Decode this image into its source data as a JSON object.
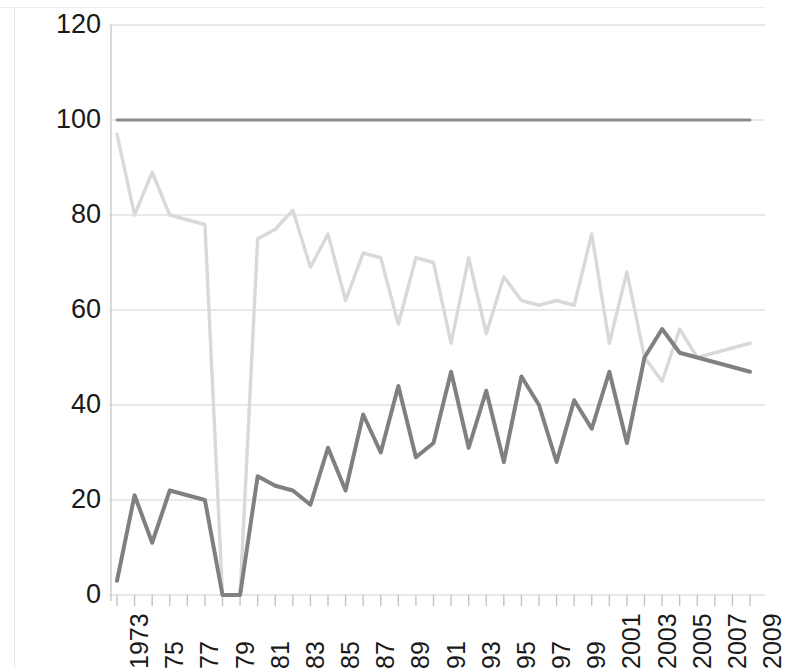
{
  "chart_data": {
    "type": "line",
    "title": "",
    "xlabel": "",
    "ylabel": "",
    "ylim": [
      0,
      120
    ],
    "ytick_values": [
      0,
      20,
      40,
      60,
      80,
      100,
      120
    ],
    "ytick_labels": [
      "0",
      "20",
      "40",
      "60",
      "80",
      "100",
      "120"
    ],
    "grid": true,
    "grid_color": "#d4d4d4",
    "legend": "none",
    "x": [
      1973,
      1974,
      1975,
      1976,
      1977,
      1978,
      1979,
      1980,
      1981,
      1982,
      1983,
      1984,
      1985,
      1986,
      1987,
      1988,
      1989,
      1990,
      1991,
      1992,
      1993,
      1994,
      1995,
      1996,
      1997,
      1998,
      1999,
      2000,
      2001,
      2002,
      2003,
      2004,
      2005,
      2006,
      2007,
      2008,
      2009
    ],
    "xtick_labels": [
      "1973",
      "75",
      "77",
      "79",
      "81",
      "83",
      "85",
      "87",
      "89",
      "91",
      "93",
      "95",
      "97",
      "99",
      "2001",
      "2003",
      "2005",
      "2007",
      "2009"
    ],
    "xtick_values": [
      1973,
      1975,
      1977,
      1979,
      1981,
      1983,
      1985,
      1987,
      1989,
      1991,
      1993,
      1995,
      1997,
      1999,
      2001,
      2003,
      2005,
      2007,
      2009
    ],
    "xlim": [
      1973,
      2009
    ],
    "series": [
      {
        "name": "reference-line",
        "color": "#8c8c8c",
        "width": 3.0,
        "values": [
          100,
          100,
          100,
          100,
          100,
          100,
          100,
          100,
          100,
          100,
          100,
          100,
          100,
          100,
          100,
          100,
          100,
          100,
          100,
          100,
          100,
          100,
          100,
          100,
          100,
          100,
          100,
          100,
          100,
          100,
          100,
          100,
          100,
          100,
          100,
          100,
          100
        ]
      },
      {
        "name": "light-series",
        "color": "#d9d9d9",
        "width": 3.4,
        "values": [
          97,
          80,
          89,
          80,
          79,
          78,
          0,
          0,
          75,
          77,
          81,
          69,
          76,
          62,
          72,
          71,
          57,
          71,
          70,
          53,
          71,
          55,
          67,
          62,
          61,
          62,
          61,
          76,
          53,
          68,
          50,
          45,
          56,
          50,
          51,
          52,
          53
        ]
      },
      {
        "name": "dark-series",
        "color": "#808080",
        "width": 4.0,
        "values": [
          3,
          21,
          11,
          22,
          21,
          20,
          0,
          0,
          25,
          23,
          22,
          19,
          31,
          22,
          38,
          30,
          44,
          29,
          32,
          47,
          31,
          43,
          28,
          46,
          40,
          28,
          41,
          35,
          47,
          32,
          50,
          56,
          51,
          50,
          49,
          48,
          47
        ]
      }
    ]
  }
}
